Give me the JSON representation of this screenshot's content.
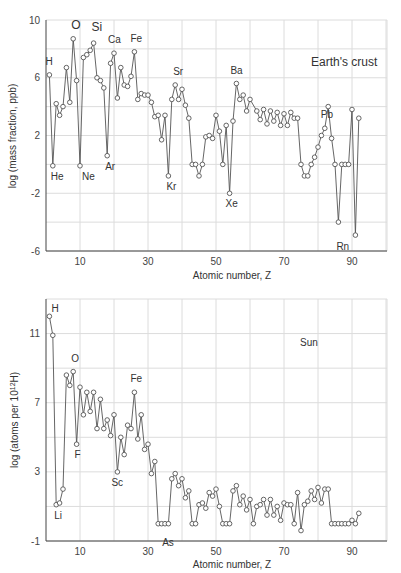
{
  "chart_data": [
    {
      "type": "line",
      "title": "Earth's crust",
      "xlabel": "Atomic number, Z",
      "ylabel": "log (mass fraction, ppb)",
      "xlim": [
        0,
        98
      ],
      "ylim": [
        -6,
        10
      ],
      "xticks": [
        10,
        30,
        50,
        70,
        90
      ],
      "yticks": [
        -6,
        -2,
        2,
        6,
        10
      ],
      "grid": true,
      "annotations": [
        {
          "label": "H",
          "z": 1
        },
        {
          "label": "He",
          "z": 2
        },
        {
          "label": "O",
          "z": 8
        },
        {
          "label": "Ne",
          "z": 10
        },
        {
          "label": "Si",
          "z": 14
        },
        {
          "label": "Ar",
          "z": 18
        },
        {
          "label": "Ca",
          "z": 20
        },
        {
          "label": "Fe",
          "z": 26
        },
        {
          "label": "Kr",
          "z": 36
        },
        {
          "label": "Sr",
          "z": 38
        },
        {
          "label": "Xe",
          "z": 54
        },
        {
          "label": "Ba",
          "z": 56
        },
        {
          "label": "Pb",
          "z": 82
        },
        {
          "label": "Rn",
          "z": 86
        }
      ],
      "x": [
        1,
        2,
        3,
        4,
        5,
        6,
        7,
        8,
        9,
        10,
        11,
        12,
        13,
        14,
        15,
        16,
        17,
        18,
        19,
        20,
        21,
        22,
        23,
        24,
        25,
        26,
        27,
        28,
        29,
        30,
        31,
        32,
        33,
        34,
        35,
        36,
        37,
        38,
        39,
        40,
        41,
        42,
        43,
        44,
        45,
        46,
        47,
        48,
        49,
        50,
        51,
        52,
        53,
        54,
        55,
        56,
        57,
        58,
        59,
        60,
        62,
        63,
        64,
        65,
        66,
        67,
        68,
        69,
        70,
        71,
        72,
        73,
        74,
        75,
        76,
        77,
        78,
        79,
        80,
        81,
        82,
        83,
        84,
        85,
        86,
        87,
        88,
        89,
        90,
        91,
        92
      ],
      "values": [
        6.2,
        -0.1,
        4.2,
        3.4,
        4.0,
        6.7,
        4.3,
        8.7,
        5.8,
        -0.1,
        7.4,
        7.6,
        7.9,
        8.4,
        6.0,
        5.8,
        5.3,
        0.6,
        7.0,
        7.7,
        4.6,
        6.7,
        5.5,
        5.4,
        6.1,
        7.8,
        4.5,
        4.9,
        4.8,
        4.8,
        4.3,
        3.3,
        3.4,
        1.7,
        3.4,
        -0.8,
        4.5,
        5.5,
        4.5,
        5.2,
        4.1,
        3.2,
        0.0,
        0.0,
        -0.8,
        0.0,
        1.9,
        2.0,
        1.8,
        3.4,
        2.3,
        0.0,
        2.7,
        -2.0,
        3.0,
        5.6,
        4.5,
        4.8,
        3.7,
        4.5,
        3.7,
        3.1,
        3.8,
        2.8,
        3.7,
        3.0,
        3.6,
        2.7,
        3.5,
        2.7,
        3.6,
        3.2,
        3.2,
        0.0,
        -0.8,
        -0.8,
        0.0,
        0.5,
        1.2,
        2.0,
        2.5,
        4.0,
        1.8,
        0.0,
        -4.0,
        0.0,
        0.0,
        0.0,
        3.8,
        -4.9,
        3.2
      ]
    },
    {
      "type": "line",
      "title": "Sun",
      "xlabel": "Atomic number, Z",
      "ylabel": "log (atoms per 10^12 H)",
      "ylabel_display": "log (atoms per 10",
      "ylabel_sup": "12",
      "ylabel_tail": "H)",
      "xlim": [
        0,
        98
      ],
      "ylim": [
        -1,
        13
      ],
      "xticks": [
        10,
        30,
        50,
        70,
        90
      ],
      "yticks": [
        -1,
        3,
        7,
        11
      ],
      "grid": true,
      "annotations": [
        {
          "label": "H",
          "z": 1
        },
        {
          "label": "Li",
          "z": 3
        },
        {
          "label": "O",
          "z": 8
        },
        {
          "label": "F",
          "z": 9
        },
        {
          "label": "Sc",
          "z": 21
        },
        {
          "label": "Fe",
          "z": 26
        },
        {
          "label": "As",
          "z": 33
        }
      ],
      "x": [
        1,
        2,
        3,
        4,
        5,
        6,
        7,
        8,
        9,
        10,
        11,
        12,
        13,
        14,
        15,
        16,
        17,
        18,
        19,
        20,
        21,
        22,
        23,
        24,
        25,
        26,
        27,
        28,
        29,
        30,
        31,
        32,
        33,
        34,
        35,
        36,
        37,
        38,
        39,
        40,
        41,
        42,
        43,
        44,
        45,
        46,
        47,
        48,
        49,
        50,
        51,
        52,
        53,
        54,
        55,
        56,
        57,
        58,
        59,
        60,
        61,
        62,
        63,
        64,
        65,
        66,
        67,
        68,
        69,
        70,
        71,
        72,
        73,
        74,
        75,
        76,
        77,
        78,
        79,
        80,
        81,
        82,
        83,
        84,
        85,
        86,
        87,
        88,
        89,
        90,
        91,
        92
      ],
      "values": [
        12.0,
        10.9,
        1.1,
        1.2,
        2.0,
        8.6,
        8.0,
        8.8,
        4.6,
        7.9,
        6.3,
        7.6,
        6.5,
        7.6,
        5.5,
        7.2,
        5.5,
        6.0,
        5.1,
        6.3,
        3.0,
        5.0,
        4.0,
        5.7,
        5.5,
        7.6,
        4.9,
        6.3,
        4.3,
        4.6,
        2.9,
        3.6,
        0.0,
        0.0,
        0.0,
        0.0,
        2.6,
        2.9,
        2.2,
        2.6,
        1.5,
        1.9,
        0.0,
        0.0,
        1.1,
        1.2,
        0.9,
        1.8,
        1.6,
        2.0,
        1.0,
        0.0,
        0.0,
        0.0,
        1.9,
        2.2,
        1.1,
        1.6,
        0.8,
        1.4,
        0.0,
        1.0,
        1.1,
        1.4,
        0.5,
        1.4,
        0.5,
        1.0,
        0.2,
        1.2,
        1.1,
        1.1,
        0.0,
        1.8,
        -0.4,
        1.1,
        1.3,
        1.9,
        1.4,
        2.1,
        1.2,
        2.0,
        2.0,
        0.0,
        0.0,
        0.0,
        0.0,
        0.0,
        0.0,
        0.2,
        0.0,
        0.6
      ]
    }
  ]
}
